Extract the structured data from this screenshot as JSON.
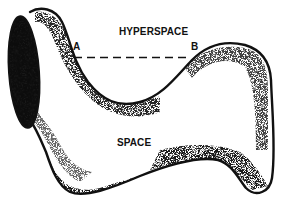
{
  "diagram": {
    "labels": {
      "hyperspace": "HYPERSPACE",
      "space": "SPACE",
      "point_a": "A",
      "point_b": "B"
    },
    "colors": {
      "outline": "#111111",
      "shading": "#222222",
      "background": "#ffffff"
    }
  }
}
